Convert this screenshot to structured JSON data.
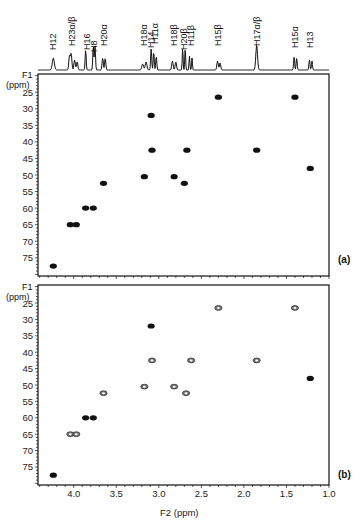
{
  "figure": {
    "panel_a_label": "(a)",
    "panel_b_label": "(b)",
    "y_axis_label_line1": "F1",
    "y_axis_label_line2": "(ppm)",
    "x_axis_label": "F2 (ppm)"
  },
  "chart_data": {
    "type": "scatter",
    "xlabel": "F2 (ppm)",
    "ylabel": "F1 (ppm)",
    "xlim": [
      4.42,
      1.0
    ],
    "ylim": [
      80.5,
      19.5
    ],
    "x_reversed": true,
    "y_reversed": true,
    "x_ticks": [
      4.0,
      3.5,
      3.0,
      2.5,
      2.0,
      1.5,
      1.0
    ],
    "x_tick_labels": [
      "4.0",
      "3.5",
      "3.0",
      "2.5",
      "2.0",
      "1.5",
      "1.0"
    ],
    "y_ticks": [
      25,
      30,
      35,
      40,
      45,
      50,
      55,
      60,
      65,
      70,
      75
    ],
    "y_tick_labels": [
      "25",
      "30",
      "35",
      "40",
      "45",
      "50",
      "55",
      "60",
      "65",
      "70",
      "75"
    ],
    "grid": false,
    "projection_labels": [
      {
        "label": "H12",
        "ppm": 4.24
      },
      {
        "label": "H23α/β",
        "ppm": 4.02
      },
      {
        "label": "H16",
        "ppm": 3.85
      },
      {
        "label": "H8",
        "ppm": 3.76
      },
      {
        "label": "H20α",
        "ppm": 3.65
      },
      {
        "label": "H18α",
        "ppm": 3.17
      },
      {
        "label": "H14",
        "ppm": 3.09
      },
      {
        "label": "H11α",
        "ppm": 3.04
      },
      {
        "label": "H18β",
        "ppm": 2.82
      },
      {
        "label": "H20β",
        "ppm": 2.7
      },
      {
        "label": "H11β",
        "ppm": 2.62
      },
      {
        "label": "H15β",
        "ppm": 2.3
      },
      {
        "label": "H17α/β",
        "ppm": 1.85
      },
      {
        "label": "H15α",
        "ppm": 1.4
      },
      {
        "label": "H13",
        "ppm": 1.22
      }
    ],
    "series": [
      {
        "name": "Panel (a)",
        "points": [
          {
            "x": 4.24,
            "y": 77.5,
            "phase": "positive"
          },
          {
            "x": 4.04,
            "y": 65.0,
            "phase": "positive"
          },
          {
            "x": 3.97,
            "y": 65.0,
            "phase": "positive"
          },
          {
            "x": 3.86,
            "y": 60.0,
            "phase": "positive"
          },
          {
            "x": 3.77,
            "y": 60.0,
            "phase": "positive"
          },
          {
            "x": 3.65,
            "y": 52.5,
            "phase": "positive"
          },
          {
            "x": 3.17,
            "y": 50.5,
            "phase": "positive"
          },
          {
            "x": 3.09,
            "y": 32.0,
            "phase": "positive"
          },
          {
            "x": 3.08,
            "y": 42.5,
            "phase": "positive"
          },
          {
            "x": 2.82,
            "y": 50.5,
            "phase": "positive"
          },
          {
            "x": 2.67,
            "y": 42.5,
            "phase": "positive"
          },
          {
            "x": 2.7,
            "y": 52.5,
            "phase": "positive"
          },
          {
            "x": 2.3,
            "y": 26.5,
            "phase": "positive"
          },
          {
            "x": 1.85,
            "y": 42.5,
            "phase": "positive"
          },
          {
            "x": 1.4,
            "y": 26.5,
            "phase": "positive"
          },
          {
            "x": 1.22,
            "y": 48.0,
            "phase": "positive"
          }
        ]
      },
      {
        "name": "Panel (b)",
        "points": [
          {
            "x": 4.24,
            "y": 77.5,
            "phase": "positive"
          },
          {
            "x": 4.04,
            "y": 65.0,
            "phase": "negative"
          },
          {
            "x": 3.97,
            "y": 65.0,
            "phase": "negative"
          },
          {
            "x": 3.86,
            "y": 60.0,
            "phase": "positive"
          },
          {
            "x": 3.77,
            "y": 60.0,
            "phase": "positive"
          },
          {
            "x": 3.65,
            "y": 52.5,
            "phase": "negative"
          },
          {
            "x": 3.17,
            "y": 50.5,
            "phase": "negative"
          },
          {
            "x": 3.09,
            "y": 32.0,
            "phase": "positive"
          },
          {
            "x": 3.08,
            "y": 42.5,
            "phase": "negative"
          },
          {
            "x": 2.82,
            "y": 50.5,
            "phase": "negative"
          },
          {
            "x": 2.62,
            "y": 42.5,
            "phase": "negative"
          },
          {
            "x": 2.68,
            "y": 52.5,
            "phase": "negative"
          },
          {
            "x": 2.3,
            "y": 26.5,
            "phase": "negative"
          },
          {
            "x": 1.85,
            "y": 42.5,
            "phase": "negative"
          },
          {
            "x": 1.4,
            "y": 26.5,
            "phase": "negative"
          },
          {
            "x": 1.22,
            "y": 48.0,
            "phase": "positive"
          }
        ]
      }
    ]
  }
}
